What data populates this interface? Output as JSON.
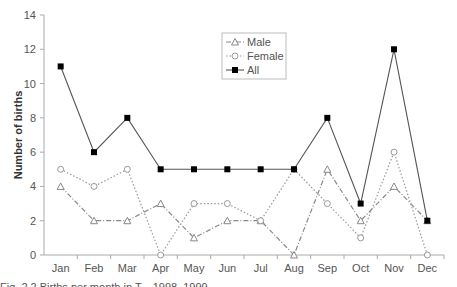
{
  "chart_data": {
    "type": "line",
    "title": "",
    "xlabel": "",
    "ylabel": "Number of births",
    "categories": [
      "Jan",
      "Feb",
      "Mar",
      "Apr",
      "May",
      "Jun",
      "Jul",
      "Aug",
      "Sep",
      "Oct",
      "Nov",
      "Dec"
    ],
    "ylim": [
      0,
      14
    ],
    "yticks": [
      0,
      2,
      4,
      6,
      8,
      10,
      12,
      14
    ],
    "grid": false,
    "legend_position": "top-center",
    "series": [
      {
        "name": "Male",
        "marker": "triangle-open",
        "line": "dash-dot",
        "color": "#888888",
        "values": [
          4,
          2,
          2,
          3,
          1,
          2,
          2,
          0,
          5,
          2,
          4,
          2
        ]
      },
      {
        "name": "Female",
        "marker": "circle-open",
        "line": "dotted",
        "color": "#999999",
        "values": [
          5,
          4,
          5,
          0,
          3,
          3,
          2,
          5,
          3,
          1,
          6,
          0
        ]
      },
      {
        "name": "All",
        "marker": "square-filled",
        "line": "solid",
        "color": "#555555",
        "values": [
          11,
          6,
          8,
          5,
          5,
          5,
          5,
          5,
          8,
          3,
          12,
          2
        ]
      }
    ]
  },
  "caption": "Fig. 2.2    Births per month in T...                1998–1999"
}
